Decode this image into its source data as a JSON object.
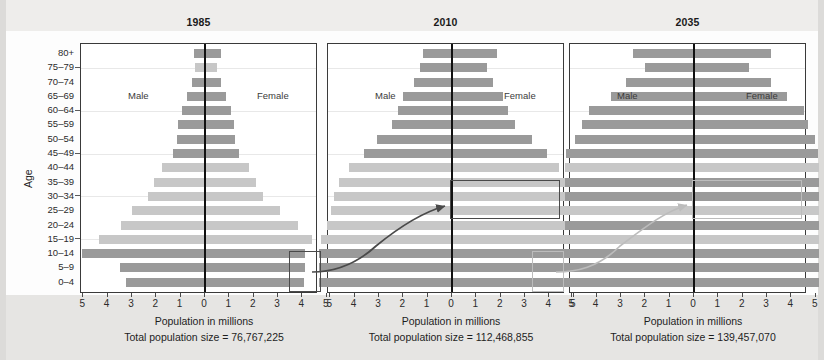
{
  "figure": {
    "axis_title": "Population in millions",
    "y_axis_title": "Age",
    "male_label": "Male",
    "female_label": "Female",
    "total_prefix": "Total population size = ",
    "tick_labels_left": [
      "5",
      "4",
      "3",
      "2",
      "1"
    ],
    "tick_label_center": "0",
    "tick_labels_right": [
      "1",
      "2",
      "3",
      "4",
      "5"
    ],
    "age_groups": [
      "80+",
      "75–79",
      "70–74",
      "65–69",
      "60–64",
      "55–59",
      "50–54",
      "45–49",
      "40–44",
      "35–39",
      "30–34",
      "25–29",
      "20–24",
      "15–19",
      "10–14",
      "5–9",
      "0–4"
    ],
    "colors": {
      "bar_dark": "#9a9a9a",
      "bar_light": "#c7c7c7",
      "center_line": "#111111",
      "panel_border": "#3a3a3a",
      "highlight_dark": "#4a4a4a",
      "highlight_light": "#bcbcbc",
      "page_background": "#e9e8e6"
    },
    "panels": [
      {
        "title": "1985",
        "total": "76,767,225",
        "total_text": "Total population size = 76,767,225"
      },
      {
        "title": "2010",
        "total": "112,468,855",
        "total_text": "Total population size = 112,468,855"
      },
      {
        "title": "2035",
        "total": "139,457,070",
        "total_text": "Total population size = 139,457,070"
      }
    ]
  },
  "chart_data": {
    "type": "bar",
    "subtype": "population-pyramid",
    "title": "",
    "xlabel": "Population in millions",
    "ylabel": "Age",
    "xlim": [
      -5.6,
      5.6
    ],
    "xticks": [
      -5,
      -4,
      -3,
      -2,
      -1,
      0,
      1,
      2,
      3,
      4,
      5
    ],
    "xtick_labels": [
      "5",
      "4",
      "3",
      "2",
      "1",
      "0",
      "1",
      "2",
      "3",
      "4",
      "5"
    ],
    "grid": true,
    "grid_axis": "y",
    "legend": "in-plot text labels: Male (left of centre), Female (right of centre)",
    "categories": [
      "80+",
      "75–79",
      "70–74",
      "65–69",
      "60–64",
      "55–59",
      "50–54",
      "45–49",
      "40–44",
      "35–39",
      "30–34",
      "25–29",
      "20–24",
      "15–19",
      "10–14",
      "5–9",
      "0–4"
    ],
    "panels": [
      {
        "year": "1985",
        "total_population": 76767225,
        "total_population_label": "Total population size = 76,767,225",
        "bar_shade": [
          "dark",
          "light",
          "dark",
          "dark",
          "dark",
          "dark",
          "dark",
          "dark",
          "light",
          "light",
          "light",
          "light",
          "light",
          "light",
          "dark",
          "dark",
          "dark"
        ],
        "series": [
          {
            "name": "Male",
            "values": [
              0.45,
              0.4,
              0.55,
              0.75,
              0.95,
              1.1,
              1.15,
              1.3,
              1.75,
              2.1,
              2.35,
              3.0,
              3.45,
              4.35,
              5.05,
              3.5,
              3.25
            ]
          },
          {
            "name": "Female",
            "values": [
              0.65,
              0.5,
              0.65,
              0.85,
              1.05,
              1.2,
              1.25,
              1.4,
              1.8,
              2.1,
              2.4,
              3.1,
              3.8,
              4.4,
              4.1,
              4.1,
              4.05
            ]
          }
        ]
      },
      {
        "year": "2010",
        "total_population": 112468855,
        "total_population_label": "Total population size = 112,468,855",
        "bar_shade": [
          "dark",
          "dark",
          "dark",
          "dark",
          "dark",
          "dark",
          "dark",
          "dark",
          "light",
          "light",
          "light",
          "light",
          "light",
          "light",
          "dark",
          "dark",
          "dark"
        ],
        "series": [
          {
            "name": "Male",
            "values": [
              1.2,
              1.3,
              1.55,
              2.0,
              2.2,
              2.45,
              3.1,
              3.6,
              4.25,
              4.65,
              4.85,
              4.95,
              5.15,
              5.4,
              5.45,
              5.45,
              5.45
            ]
          },
          {
            "name": "Female",
            "values": [
              1.85,
              1.45,
              1.7,
              2.1,
              2.3,
              2.6,
              3.3,
              3.9,
              4.4,
              4.7,
              4.9,
              5.0,
              5.2,
              5.45,
              5.5,
              5.5,
              5.5
            ]
          }
        ]
      },
      {
        "year": "2035",
        "total_population": 139457070,
        "total_population_label": "Total population size = 139,457,070",
        "bar_shade": [
          "dark",
          "dark",
          "dark",
          "dark",
          "dark",
          "dark",
          "dark",
          "dark",
          "light",
          "dark",
          "dark",
          "light",
          "dark",
          "light",
          "dark",
          "dark",
          "dark"
        ],
        "series": [
          {
            "name": "Male",
            "values": [
              2.5,
              2.0,
              2.8,
              3.4,
              4.3,
              4.6,
              4.9,
              5.25,
              5.3,
              5.3,
              5.3,
              5.35,
              5.3,
              5.35,
              5.3,
              5.3,
              5.3
            ]
          },
          {
            "name": "Female",
            "values": [
              3.15,
              2.25,
              3.15,
              3.8,
              4.5,
              4.7,
              4.95,
              5.1,
              5.15,
              5.15,
              5.15,
              5.15,
              5.15,
              5.15,
              5.15,
              5.15,
              5.15
            ]
          }
        ]
      }
    ],
    "annotations": [
      {
        "name": "cohort-highlight-1985",
        "panel": "1985",
        "age_groups": [
          "10–14",
          "5–9",
          "0–4"
        ],
        "side": "female-tail",
        "style": "dark-rectangle"
      },
      {
        "name": "cohort-highlight-2010",
        "panel": "2010",
        "age_groups": [
          "35–39",
          "30–34",
          "25–29"
        ],
        "side": "female",
        "style": "dark-rectangle"
      },
      {
        "name": "cohort-highlight-2010-lower",
        "panel": "2010",
        "age_groups": [
          "10–14",
          "5–9",
          "0–4"
        ],
        "side": "female-tail",
        "style": "light-rectangle"
      },
      {
        "name": "cohort-highlight-2035",
        "panel": "2035",
        "age_groups": [
          "35–39",
          "30–34",
          "25–29"
        ],
        "side": "female",
        "style": "light-rectangle"
      },
      {
        "name": "cohort-arrow-1985-to-2010",
        "from_panel": "1985",
        "to_panel": "2010",
        "style": "dark-curved-arrow"
      },
      {
        "name": "cohort-arrow-2010-to-2035",
        "from_panel": "2010",
        "to_panel": "2035",
        "style": "light-curved-arrow"
      }
    ]
  }
}
